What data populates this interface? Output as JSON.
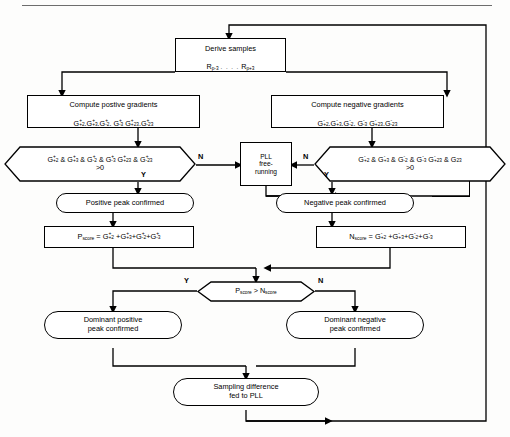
{
  "diagram": {
    "title_rule": true,
    "nodes": {
      "derive": {
        "line1": "Derive samples",
        "line2_a": "R",
        "line2_a_sub": "p-3",
        "line2_dots": ". . . .",
        "line2_b": "R",
        "line2_b_sub": "p+3"
      },
      "pos_grad": {
        "line1": "Compute postive gradients",
        "line2": "G⁺₊₂ . G⁺₊₃ . G⁺₋₂ . G⁺₋₃  G⁺₊₂₃ . G⁺₋₂₃"
      },
      "neg_grad": {
        "line1": "Compute negative gradients",
        "line2": "G⁻₊₂ . G⁻₊₃ . G⁻₋₂ . G⁻₋₃  G⁻₊₂₃ . G⁻₋₂₃"
      },
      "pos_test": {
        "line1": "G⁺₊₂ & G⁺₊₃ & G⁺₋₂ & G⁺₋₃  G⁺₊₂₃ & G⁺₋₂₃",
        "line2": ">0",
        "yes": "Y",
        "no": "N"
      },
      "neg_test": {
        "line1": "G⁻₊₂ & G⁻₊₃ & G⁻₋₂ & G⁻₋₃  G⁻₊₂₃ & G⁻₂₃",
        "line2": ">0",
        "yes": "Y",
        "no": "N"
      },
      "pll": {
        "line1": "PLL",
        "line2": "free-",
        "line3": "running"
      },
      "pos_peak": {
        "label": "Positive peak confirmed"
      },
      "neg_peak": {
        "label": "Negative peak confirmed"
      },
      "pscore": {
        "label": "P_score = G⁺₊₂ + G⁺₊₃ + G⁺₋₂ + G⁺₋₃"
      },
      "nscore": {
        "label": "N_score = G⁻₊₂ + G⁻₊₃ + G⁻₋₂ + G⁻₋₃"
      },
      "compare": {
        "label": "P_score > N_score",
        "yes": "Y",
        "no": "N"
      },
      "dom_pos": {
        "line1": "Dominant positive",
        "line2": "peak confirmed"
      },
      "dom_neg": {
        "line1": "Dominant negative",
        "line2": "peak confirmed"
      },
      "sampling": {
        "line1": "Sampling difference",
        "line2": "fed to PLL"
      }
    },
    "symbols": {
      "score_sub": "score",
      "p": "P",
      "n": "N",
      "g": "G",
      "plus": "+",
      "minus": "-",
      "gt0": ">0",
      "yes": "Y",
      "no": "N"
    },
    "gradient_terms_positive": [
      "+2",
      "+3",
      "-2",
      "-3",
      "+23",
      "-23"
    ],
    "gradient_terms_negative": [
      "+2",
      "+3",
      "-2",
      "-3",
      "+23",
      "23"
    ],
    "colors": {
      "line": "#000000",
      "background": "#fdfdfc",
      "rule": "#6d6d6d"
    }
  }
}
